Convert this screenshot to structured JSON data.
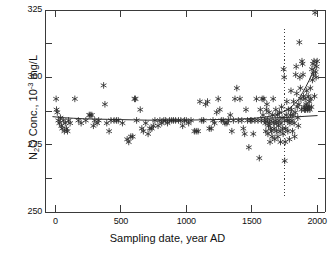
{
  "chart_data": {
    "type": "scatter",
    "title": "",
    "xlabel": "Sampling date, year AD",
    "ylabel_parts": {
      "lead": "N",
      "sub": "2",
      "mid": "O Conc., 10",
      "sup": "-3",
      "tail": " mg/L"
    },
    "ylabel": "N2O Conc., 10-3 mg/L",
    "xlim": [
      -80,
      2060
    ],
    "ylim": [
      250,
      325
    ],
    "xticks": [
      0,
      500,
      1000,
      1500,
      2000
    ],
    "xtick_labels": [
      "0",
      "500",
      "1000",
      "1500",
      "2000"
    ],
    "yticks": [
      250,
      275,
      300,
      325
    ],
    "ytick_labels": [
      "250",
      "275",
      "300",
      "325"
    ],
    "yminor_ticks": [
      262.5,
      287.5,
      312.5
    ],
    "grid": false,
    "legend": "none",
    "marker": "asterisk",
    "marker_color": "#2b2b2b",
    "curve_color": "#2b2b2b",
    "axis_color": "#3a3a3a",
    "annotations": [
      {
        "name": "preindustrial-divider",
        "type": "vline",
        "x": 1750,
        "y_from": 256,
        "y_to": 318,
        "style": "dotted"
      }
    ],
    "series": [
      {
        "name": "N2O measurements",
        "type": "scatter",
        "points": [
          [
            5,
            292
          ],
          [
            8,
            288
          ],
          [
            14,
            287
          ],
          [
            22,
            284
          ],
          [
            30,
            283
          ],
          [
            38,
            285
          ],
          [
            45,
            282
          ],
          [
            52,
            281
          ],
          [
            60,
            284
          ],
          [
            68,
            280
          ],
          [
            75,
            283
          ],
          [
            84,
            281
          ],
          [
            92,
            280
          ],
          [
            100,
            284
          ],
          [
            112,
            283
          ],
          [
            148,
            292
          ],
          [
            175,
            284
          ],
          [
            196,
            283
          ],
          [
            232,
            284
          ],
          [
            258,
            286
          ],
          [
            266,
            286
          ],
          [
            278,
            286
          ],
          [
            290,
            282
          ],
          [
            300,
            284
          ],
          [
            318,
            283
          ],
          [
            330,
            284
          ],
          [
            368,
            297
          ],
          [
            378,
            290
          ],
          [
            392,
            283
          ],
          [
            410,
            280
          ],
          [
            424,
            284
          ],
          [
            448,
            284
          ],
          [
            466,
            284
          ],
          [
            480,
            284
          ],
          [
            512,
            283
          ],
          [
            548,
            277
          ],
          [
            560,
            276
          ],
          [
            576,
            278
          ],
          [
            590,
            278
          ],
          [
            604,
            292
          ],
          [
            612,
            292
          ],
          [
            620,
            284
          ],
          [
            648,
            288
          ],
          [
            660,
            281
          ],
          [
            672,
            280
          ],
          [
            690,
            283
          ],
          [
            708,
            279
          ],
          [
            722,
            281
          ],
          [
            736,
            281
          ],
          [
            748,
            282
          ],
          [
            760,
            284
          ],
          [
            784,
            282
          ],
          [
            798,
            284
          ],
          [
            812,
            283
          ],
          [
            828,
            284
          ],
          [
            842,
            284
          ],
          [
            856,
            283
          ],
          [
            872,
            284
          ],
          [
            888,
            284
          ],
          [
            902,
            284
          ],
          [
            918,
            284
          ],
          [
            940,
            284
          ],
          [
            958,
            284
          ],
          [
            972,
            282
          ],
          [
            986,
            284
          ],
          [
            1000,
            284
          ],
          [
            1018,
            283
          ],
          [
            1036,
            284
          ],
          [
            1062,
            280
          ],
          [
            1076,
            280
          ],
          [
            1090,
            280
          ],
          [
            1104,
            291
          ],
          [
            1118,
            284
          ],
          [
            1132,
            284
          ],
          [
            1148,
            290
          ],
          [
            1162,
            291
          ],
          [
            1176,
            281
          ],
          [
            1190,
            281
          ],
          [
            1204,
            284
          ],
          [
            1216,
            283
          ],
          [
            1232,
            287
          ],
          [
            1244,
            292
          ],
          [
            1256,
            288
          ],
          [
            1268,
            284
          ],
          [
            1282,
            284
          ],
          [
            1296,
            283
          ],
          [
            1310,
            283
          ],
          [
            1322,
            284
          ],
          [
            1336,
            286
          ],
          [
            1348,
            280
          ],
          [
            1360,
            284
          ],
          [
            1372,
            292
          ],
          [
            1386,
            296
          ],
          [
            1398,
            284
          ],
          [
            1410,
            292
          ],
          [
            1424,
            284
          ],
          [
            1436,
            281
          ],
          [
            1446,
            279
          ],
          [
            1456,
            288
          ],
          [
            1468,
            284
          ],
          [
            1478,
            274
          ],
          [
            1490,
            284
          ],
          [
            1500,
            284
          ],
          [
            1512,
            279
          ],
          [
            1524,
            284
          ],
          [
            1536,
            292
          ],
          [
            1548,
            284
          ],
          [
            1558,
            270
          ],
          [
            1566,
            288
          ],
          [
            1574,
            284
          ],
          [
            1580,
            292
          ],
          [
            1586,
            286
          ],
          [
            1592,
            292
          ],
          [
            1598,
            284
          ],
          [
            1604,
            283
          ],
          [
            1608,
            280
          ],
          [
            1612,
            288
          ],
          [
            1616,
            290
          ],
          [
            1620,
            284
          ],
          [
            1624,
            279
          ],
          [
            1628,
            282
          ],
          [
            1632,
            287
          ],
          [
            1636,
            283
          ],
          [
            1640,
            276
          ],
          [
            1644,
            281
          ],
          [
            1648,
            284
          ],
          [
            1652,
            280
          ],
          [
            1656,
            278
          ],
          [
            1660,
            286
          ],
          [
            1664,
            292
          ],
          [
            1668,
            283
          ],
          [
            1672,
            281
          ],
          [
            1676,
            277
          ],
          [
            1680,
            284
          ],
          [
            1684,
            288
          ],
          [
            1688,
            280
          ],
          [
            1692,
            283
          ],
          [
            1696,
            286
          ],
          [
            1700,
            278
          ],
          [
            1704,
            282
          ],
          [
            1708,
            284
          ],
          [
            1712,
            287
          ],
          [
            1716,
            280
          ],
          [
            1720,
            276
          ],
          [
            1724,
            283
          ],
          [
            1728,
            289
          ],
          [
            1732,
            285
          ],
          [
            1736,
            281
          ],
          [
            1740,
            279
          ],
          [
            1744,
            303
          ],
          [
            1748,
            300
          ],
          [
            1752,
            284
          ],
          [
            1752,
            269
          ],
          [
            1756,
            276
          ],
          [
            1760,
            281
          ],
          [
            1764,
            286
          ],
          [
            1768,
            291
          ],
          [
            1772,
            284
          ],
          [
            1776,
            280
          ],
          [
            1780,
            288
          ],
          [
            1784,
            284
          ],
          [
            1788,
            277
          ],
          [
            1792,
            283
          ],
          [
            1796,
            286
          ],
          [
            1800,
            295
          ],
          [
            1804,
            288
          ],
          [
            1808,
            284
          ],
          [
            1812,
            280
          ],
          [
            1816,
            286
          ],
          [
            1820,
            291
          ],
          [
            1824,
            283
          ],
          [
            1828,
            278
          ],
          [
            1832,
            287
          ],
          [
            1836,
            301
          ],
          [
            1840,
            304
          ],
          [
            1844,
            294
          ],
          [
            1848,
            289
          ],
          [
            1852,
            285
          ],
          [
            1856,
            282
          ],
          [
            1860,
            290
          ],
          [
            1864,
            313
          ],
          [
            1868,
            300
          ],
          [
            1872,
            296
          ],
          [
            1876,
            292
          ],
          [
            1880,
            288
          ],
          [
            1884,
            306
          ],
          [
            1888,
            305
          ],
          [
            1892,
            301
          ],
          [
            1896,
            293
          ],
          [
            1900,
            289
          ],
          [
            1904,
            288
          ],
          [
            1908,
            292
          ],
          [
            1912,
            288
          ],
          [
            1916,
            290
          ],
          [
            1920,
            295
          ],
          [
            1924,
            289
          ],
          [
            1928,
            288
          ],
          [
            1932,
            293
          ],
          [
            1936,
            289
          ],
          [
            1940,
            291
          ],
          [
            1944,
            288
          ],
          [
            1948,
            296
          ],
          [
            1952,
            292
          ],
          [
            1956,
            289
          ],
          [
            1960,
            303
          ],
          [
            1964,
            299
          ],
          [
            1968,
            305
          ],
          [
            1972,
            301
          ],
          [
            1976,
            306
          ],
          [
            1980,
            293
          ],
          [
            1984,
            324
          ],
          [
            1988,
            302
          ],
          [
            1992,
            300
          ],
          [
            1996,
            304
          ],
          [
            2000,
            306
          ]
        ]
      },
      {
        "name": "fitted trend",
        "type": "line",
        "points": [
          [
            -20,
            285.4
          ],
          [
            60,
            285.0
          ],
          [
            140,
            284.8
          ],
          [
            220,
            284.6
          ],
          [
            300,
            284.5
          ],
          [
            400,
            284.4
          ],
          [
            500,
            284.3
          ],
          [
            600,
            284.2
          ],
          [
            700,
            284.1
          ],
          [
            800,
            284.1
          ],
          [
            900,
            284.1
          ],
          [
            1000,
            284.1
          ],
          [
            1100,
            284.2
          ],
          [
            1200,
            284.3
          ],
          [
            1300,
            284.4
          ],
          [
            1400,
            284.5
          ],
          [
            1500,
            284.7
          ],
          [
            1600,
            285.2
          ],
          [
            1680,
            286.0
          ],
          [
            1740,
            287.2
          ],
          [
            1790,
            288.6
          ],
          [
            1830,
            290.2
          ],
          [
            1860,
            292.0
          ],
          [
            1890,
            294.4
          ],
          [
            1915,
            296.6
          ],
          [
            1940,
            299.0
          ],
          [
            1960,
            301.2
          ],
          [
            1980,
            303.6
          ],
          [
            2000,
            306.0
          ]
        ]
      },
      {
        "name": "plateau reference",
        "type": "line",
        "points": [
          [
            1600,
            284.8
          ],
          [
            1700,
            285.0
          ],
          [
            1800,
            285.2
          ],
          [
            1900,
            285.5
          ],
          [
            2000,
            285.8
          ]
        ]
      }
    ]
  },
  "axes": {
    "frame": {
      "left_px": 45,
      "right_px": 325,
      "top_px": 10,
      "bottom_px": 212
    }
  }
}
